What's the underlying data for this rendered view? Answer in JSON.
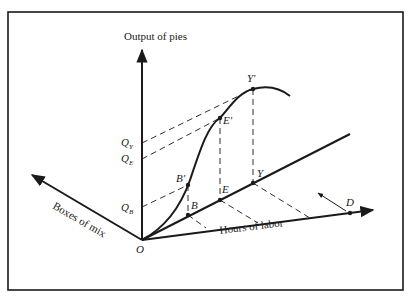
{
  "diagram": {
    "axes": {
      "vertical_label": "Output of pies",
      "left_label": "Boxes of mix",
      "right_label": "Hours of labor",
      "origin_label": "O"
    },
    "points": {
      "B": "B",
      "B_prime": "B'",
      "E": "E",
      "E_prime": "E'",
      "Y": "Y",
      "Y_prime": "Y'",
      "D": "D"
    },
    "q_labels": {
      "QY": {
        "main": "Q",
        "sub": "Y"
      },
      "QE": {
        "main": "Q",
        "sub": "E"
      },
      "QB": {
        "main": "Q",
        "sub": "B"
      }
    },
    "colors": {
      "ink": "#1a1a1a",
      "background": "#ffffff"
    }
  }
}
